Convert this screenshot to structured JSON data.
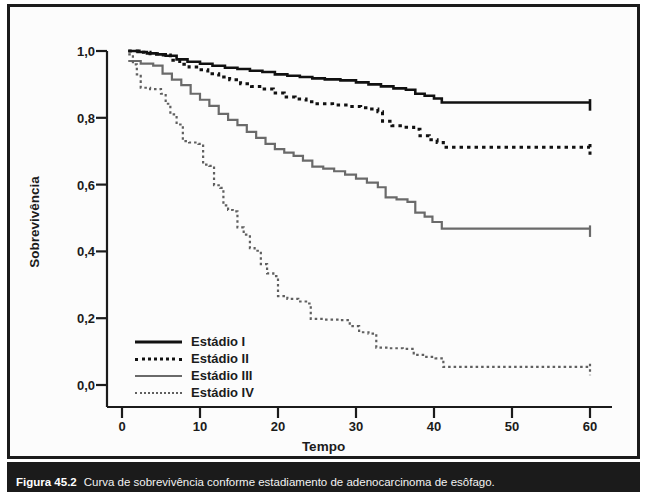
{
  "figure": {
    "caption_label": "Figura 45.2",
    "caption_text": "Curva de sobrevivência conforme estadiamento de adenocarcinoma de esôfago."
  },
  "colors": {
    "frame": "#1b1b1b",
    "background": "#fcfcfc",
    "stage_i": "#111111",
    "stage_ii": "#111111",
    "stage_iii": "#6a6a6a",
    "stage_iv": "#5f5f5f",
    "text": "#1b1b1b"
  },
  "axes": {
    "y_title": "Sobrevivência",
    "x_title": "Tempo",
    "y_ticks": [
      "1,0",
      "0,8",
      "0,6",
      "0,4",
      "0,2",
      "0,0"
    ],
    "x_ticks": [
      "0",
      "10",
      "20",
      "30",
      "40",
      "50",
      "60"
    ]
  },
  "legend": {
    "items": [
      {
        "label": "Estádio I",
        "style": "sw-solid-thick"
      },
      {
        "label": "Estádio II",
        "style": "sw-dotted-thick"
      },
      {
        "label": "Estádio III",
        "style": "sw-solid-gray"
      },
      {
        "label": "Estádio IV",
        "style": "sw-dotted-gray"
      }
    ]
  },
  "chart_data": {
    "type": "line",
    "subtype": "kaplan-meier-step",
    "title": "Curva de sobrevivência conforme estadiamento de adenocarcinoma de esôfago",
    "xlabel": "Tempo",
    "ylabel": "Sobrevivência",
    "xlim": [
      0,
      62
    ],
    "ylim": [
      0.0,
      1.04
    ],
    "xticks": [
      0,
      10,
      20,
      30,
      40,
      50,
      60
    ],
    "yticks": [
      0.0,
      0.2,
      0.4,
      0.6,
      0.8,
      1.0
    ],
    "grid": false,
    "legend_position": "lower-left-inside",
    "series": [
      {
        "name": "Estádio I",
        "color": "#111111",
        "line_style": "solid",
        "line_width": 2.6,
        "points": [
          [
            0.8,
            1.0
          ],
          [
            2.0,
            0.997
          ],
          [
            3.2,
            0.993
          ],
          [
            4.4,
            0.99
          ],
          [
            5.6,
            0.986
          ],
          [
            7.0,
            0.975
          ],
          [
            8.4,
            0.968
          ],
          [
            10.0,
            0.962
          ],
          [
            11.6,
            0.956
          ],
          [
            13.2,
            0.95
          ],
          [
            14.8,
            0.946
          ],
          [
            16.4,
            0.941
          ],
          [
            18.0,
            0.937
          ],
          [
            19.6,
            0.93
          ],
          [
            21.2,
            0.926
          ],
          [
            22.8,
            0.922
          ],
          [
            24.4,
            0.918
          ],
          [
            26.0,
            0.915
          ],
          [
            28.0,
            0.912
          ],
          [
            30.0,
            0.906
          ],
          [
            31.6,
            0.9
          ],
          [
            33.2,
            0.894
          ],
          [
            34.8,
            0.888
          ],
          [
            36.4,
            0.884
          ],
          [
            37.6,
            0.872
          ],
          [
            38.8,
            0.866
          ],
          [
            40.0,
            0.858
          ],
          [
            41.0,
            0.846
          ],
          [
            60.0,
            0.846
          ]
        ],
        "censored_at_end": true,
        "end_value": 0.846
      },
      {
        "name": "Estádio II",
        "color": "#111111",
        "line_style": "dotted",
        "line_width": 3.0,
        "points": [
          [
            0.8,
            1.0
          ],
          [
            2.2,
            0.996
          ],
          [
            3.6,
            0.992
          ],
          [
            5.0,
            0.988
          ],
          [
            6.2,
            0.972
          ],
          [
            7.4,
            0.96
          ],
          [
            8.6,
            0.952
          ],
          [
            9.8,
            0.944
          ],
          [
            11.0,
            0.932
          ],
          [
            12.4,
            0.922
          ],
          [
            13.8,
            0.914
          ],
          [
            15.2,
            0.902
          ],
          [
            16.6,
            0.894
          ],
          [
            18.0,
            0.886
          ],
          [
            19.4,
            0.874
          ],
          [
            20.8,
            0.862
          ],
          [
            22.2,
            0.856
          ],
          [
            23.6,
            0.848
          ],
          [
            25.0,
            0.842
          ],
          [
            27.0,
            0.838
          ],
          [
            29.0,
            0.834
          ],
          [
            30.6,
            0.83
          ],
          [
            31.8,
            0.826
          ],
          [
            32.8,
            0.818
          ],
          [
            33.4,
            0.79
          ],
          [
            34.6,
            0.776
          ],
          [
            36.0,
            0.772
          ],
          [
            37.4,
            0.766
          ],
          [
            38.2,
            0.746
          ],
          [
            39.4,
            0.734
          ],
          [
            40.4,
            0.726
          ],
          [
            41.2,
            0.712
          ],
          [
            60.0,
            0.712
          ]
        ],
        "censored_at_end": true,
        "end_value": 0.712
      },
      {
        "name": "Estádio III",
        "color": "#6a6a6a",
        "line_style": "solid",
        "line_width": 2.2,
        "points": [
          [
            0.8,
            0.97
          ],
          [
            2.4,
            0.962
          ],
          [
            4.0,
            0.956
          ],
          [
            5.2,
            0.932
          ],
          [
            6.4,
            0.914
          ],
          [
            7.6,
            0.898
          ],
          [
            8.8,
            0.872
          ],
          [
            10.0,
            0.854
          ],
          [
            11.2,
            0.836
          ],
          [
            12.4,
            0.812
          ],
          [
            13.6,
            0.794
          ],
          [
            14.8,
            0.778
          ],
          [
            16.0,
            0.758
          ],
          [
            17.2,
            0.74
          ],
          [
            18.4,
            0.722
          ],
          [
            19.6,
            0.706
          ],
          [
            20.8,
            0.696
          ],
          [
            22.0,
            0.686
          ],
          [
            23.2,
            0.672
          ],
          [
            24.4,
            0.654
          ],
          [
            25.8,
            0.648
          ],
          [
            27.2,
            0.64
          ],
          [
            28.6,
            0.63
          ],
          [
            30.0,
            0.618
          ],
          [
            31.4,
            0.606
          ],
          [
            32.8,
            0.592
          ],
          [
            33.8,
            0.562
          ],
          [
            35.2,
            0.556
          ],
          [
            36.6,
            0.548
          ],
          [
            37.6,
            0.516
          ],
          [
            38.8,
            0.504
          ],
          [
            39.8,
            0.488
          ],
          [
            41.0,
            0.468
          ],
          [
            60.0,
            0.468
          ]
        ],
        "censored_at_end": true,
        "end_value": 0.468
      },
      {
        "name": "Estádio IV",
        "color": "#5f5f5f",
        "line_style": "dotted",
        "line_width": 2.2,
        "points": [
          [
            0.8,
            0.99
          ],
          [
            1.4,
            0.96
          ],
          [
            1.9,
            0.93
          ],
          [
            2.4,
            0.89
          ],
          [
            3.6,
            0.886
          ],
          [
            5.0,
            0.872
          ],
          [
            5.6,
            0.842
          ],
          [
            6.2,
            0.81
          ],
          [
            7.0,
            0.78
          ],
          [
            7.8,
            0.73
          ],
          [
            8.6,
            0.726
          ],
          [
            9.8,
            0.722
          ],
          [
            10.4,
            0.66
          ],
          [
            11.2,
            0.656
          ],
          [
            11.8,
            0.598
          ],
          [
            12.6,
            0.59
          ],
          [
            13.0,
            0.538
          ],
          [
            13.6,
            0.524
          ],
          [
            14.2,
            0.52
          ],
          [
            14.8,
            0.472
          ],
          [
            15.6,
            0.45
          ],
          [
            16.4,
            0.41
          ],
          [
            17.0,
            0.402
          ],
          [
            17.8,
            0.362
          ],
          [
            18.6,
            0.334
          ],
          [
            19.4,
            0.326
          ],
          [
            20.0,
            0.266
          ],
          [
            21.2,
            0.258
          ],
          [
            22.6,
            0.25
          ],
          [
            23.6,
            0.244
          ],
          [
            24.2,
            0.198
          ],
          [
            26.0,
            0.196
          ],
          [
            28.0,
            0.194
          ],
          [
            29.2,
            0.176
          ],
          [
            30.4,
            0.158
          ],
          [
            31.6,
            0.154
          ],
          [
            32.6,
            0.112
          ],
          [
            34.2,
            0.11
          ],
          [
            36.0,
            0.108
          ],
          [
            37.4,
            0.09
          ],
          [
            38.6,
            0.084
          ],
          [
            40.2,
            0.08
          ],
          [
            41.2,
            0.054
          ],
          [
            60.0,
            0.054
          ]
        ],
        "censored_at_end": true,
        "end_value": 0.054
      }
    ]
  }
}
